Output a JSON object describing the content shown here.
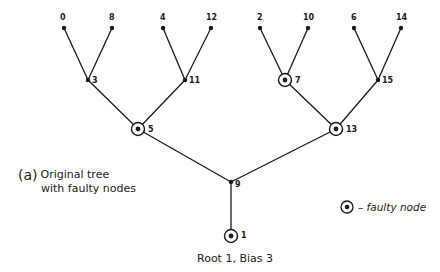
{
  "diagram": {
    "caption_label": "(a)",
    "caption_line1": "Original tree",
    "caption_line2": "with faulty nodes",
    "root_caption": "Root 1, Bias 3",
    "legend_text": "– faulty node",
    "colors": {
      "line": "#1a1a1a",
      "background": "#ffffff"
    },
    "nodes": [
      {
        "id": "0",
        "x": 64,
        "y": 28,
        "faulty": false,
        "label_dx": -4,
        "label_dy": -8
      },
      {
        "id": "8",
        "x": 112,
        "y": 28,
        "faulty": false,
        "label_dx": -3,
        "label_dy": -8
      },
      {
        "id": "4",
        "x": 163,
        "y": 28,
        "faulty": false,
        "label_dx": -3,
        "label_dy": -8
      },
      {
        "id": "12",
        "x": 211,
        "y": 28,
        "faulty": false,
        "label_dx": -5,
        "label_dy": -8
      },
      {
        "id": "2",
        "x": 260,
        "y": 28,
        "faulty": false,
        "label_dx": -3,
        "label_dy": -8
      },
      {
        "id": "10",
        "x": 308,
        "y": 28,
        "faulty": false,
        "label_dx": -5,
        "label_dy": -8
      },
      {
        "id": "6",
        "x": 354,
        "y": 28,
        "faulty": false,
        "label_dx": -3,
        "label_dy": -8
      },
      {
        "id": "14",
        "x": 401,
        "y": 28,
        "faulty": false,
        "label_dx": -5,
        "label_dy": -8
      },
      {
        "id": "3",
        "x": 88,
        "y": 80,
        "faulty": false,
        "label_dx": 4,
        "label_dy": 3
      },
      {
        "id": "11",
        "x": 185,
        "y": 80,
        "faulty": false,
        "label_dx": 4,
        "label_dy": 3
      },
      {
        "id": "7",
        "x": 285,
        "y": 80,
        "faulty": true,
        "label_dx": 10,
        "label_dy": 3
      },
      {
        "id": "15",
        "x": 378,
        "y": 80,
        "faulty": false,
        "label_dx": 4,
        "label_dy": 3
      },
      {
        "id": "5",
        "x": 138,
        "y": 129,
        "faulty": true,
        "label_dx": 10,
        "label_dy": 3
      },
      {
        "id": "13",
        "x": 336,
        "y": 129,
        "faulty": true,
        "label_dx": 10,
        "label_dy": 3
      },
      {
        "id": "9",
        "x": 231,
        "y": 182,
        "faulty": false,
        "label_dx": 4,
        "label_dy": 5
      },
      {
        "id": "1",
        "x": 231,
        "y": 236,
        "faulty": true,
        "label_dx": 10,
        "label_dy": 2
      }
    ],
    "edges": [
      [
        "0",
        "3"
      ],
      [
        "8",
        "3"
      ],
      [
        "4",
        "11"
      ],
      [
        "12",
        "11"
      ],
      [
        "2",
        "7"
      ],
      [
        "10",
        "7"
      ],
      [
        "6",
        "15"
      ],
      [
        "14",
        "15"
      ],
      [
        "3",
        "5"
      ],
      [
        "11",
        "5"
      ],
      [
        "7",
        "13"
      ],
      [
        "15",
        "13"
      ],
      [
        "5",
        "9"
      ],
      [
        "13",
        "9"
      ],
      [
        "9",
        "1"
      ]
    ]
  }
}
